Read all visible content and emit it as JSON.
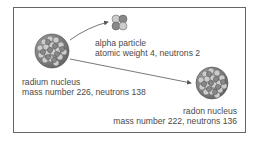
{
  "diagram": {
    "type": "alpha-decay",
    "nodes": [
      {
        "id": "radium",
        "title": "radium nucleus",
        "detail": "mass number 226, neutrons 138"
      },
      {
        "id": "alpha",
        "title": "alpha particle",
        "detail": "atomic weight 4, neutrons 2"
      },
      {
        "id": "radon",
        "title": "radon nucleus",
        "detail": "mass number 222, neutrons 136"
      }
    ],
    "edges": [
      {
        "from": "radium",
        "to": "alpha"
      },
      {
        "from": "radium",
        "to": "radon"
      }
    ]
  },
  "colors": {
    "frame": "#666666",
    "text": "#4a4a4a",
    "arrow": "#555555"
  }
}
